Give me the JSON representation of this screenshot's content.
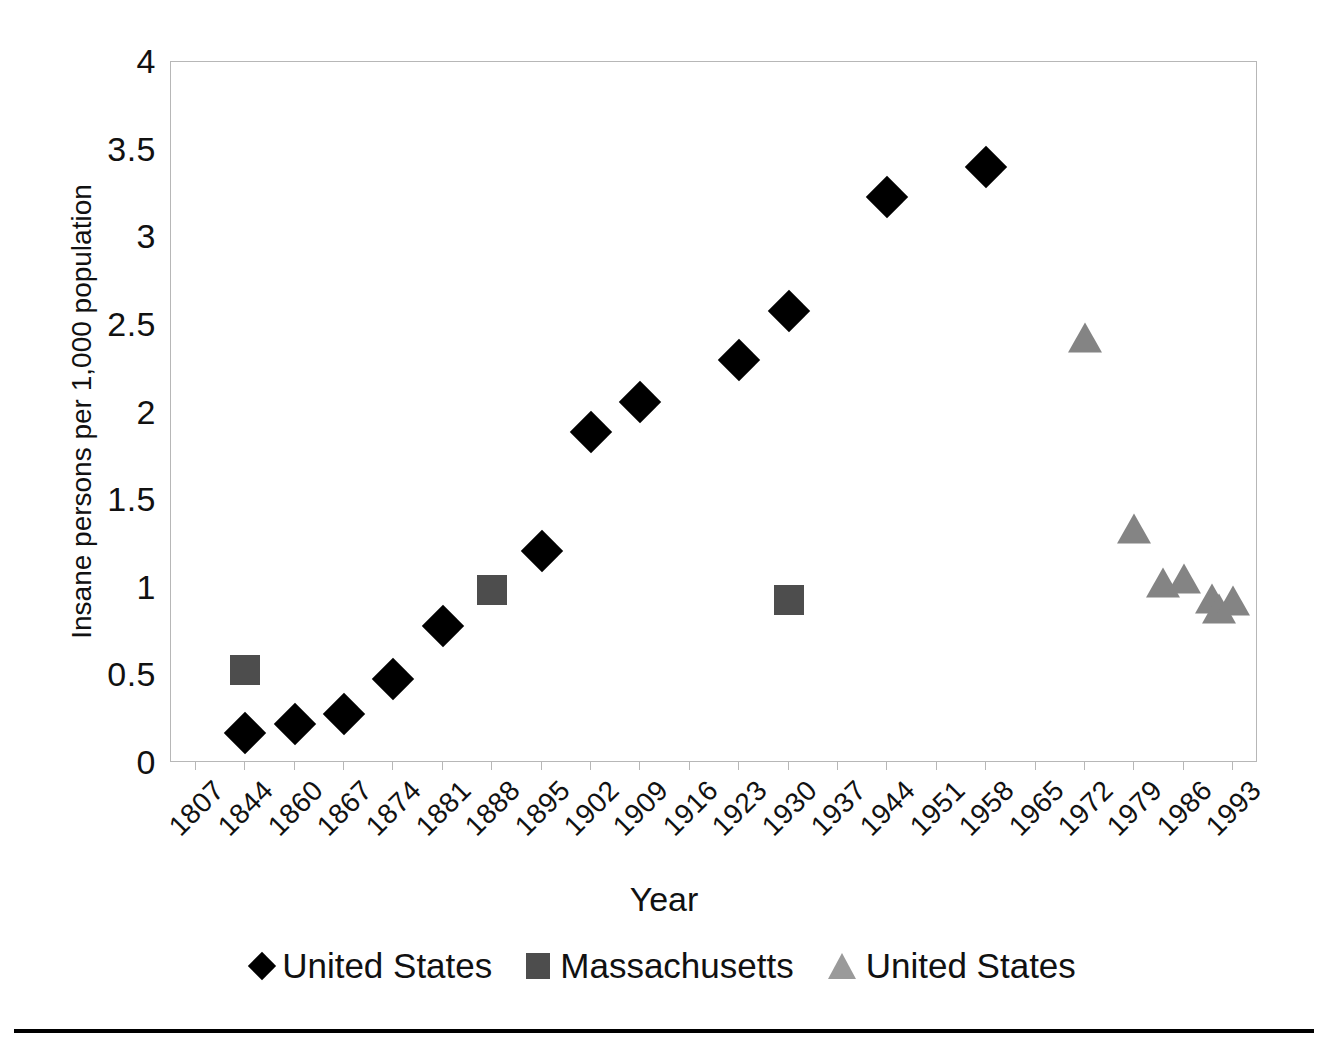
{
  "chart_data": {
    "type": "scatter",
    "title": "",
    "xlabel": "Year",
    "ylabel": "Insane persons per 1,000 population",
    "ylim": [
      0,
      4
    ],
    "y_ticks": [
      "0",
      "0.5",
      "1",
      "1.5",
      "2",
      "2.5",
      "3",
      "3.5",
      "4"
    ],
    "y_tick_values": [
      0,
      0.5,
      1,
      1.5,
      2,
      2.5,
      3,
      3.5,
      4
    ],
    "categories": [
      "1807",
      "1844",
      "1860",
      "1867",
      "1874",
      "1881",
      "1888",
      "1895",
      "1902",
      "1909",
      "1916",
      "1923",
      "1930",
      "1937",
      "1944",
      "1951",
      "1958",
      "1965",
      "1972",
      "1979",
      "1986",
      "1993"
    ],
    "grid": false,
    "legend_position": "bottom",
    "series": [
      {
        "name": "United States",
        "marker": "diamond",
        "color": "#000000",
        "points": [
          {
            "x": "1844",
            "y": 0.17
          },
          {
            "x": "1860",
            "y": 0.22
          },
          {
            "x": "1867",
            "y": 0.28
          },
          {
            "x": "1874",
            "y": 0.48
          },
          {
            "x": "1881",
            "y": 0.78
          },
          {
            "x": "1895",
            "y": 1.21
          },
          {
            "x": "1902",
            "y": 1.89
          },
          {
            "x": "1909",
            "y": 2.06
          },
          {
            "x": "1923",
            "y": 2.3
          },
          {
            "x": "1930",
            "y": 2.58
          },
          {
            "x": "1944",
            "y": 3.23
          },
          {
            "x": "1958",
            "y": 3.4
          }
        ]
      },
      {
        "name": "Massachusetts",
        "marker": "square",
        "color": "#4d4d4d",
        "points": [
          {
            "x": "1844",
            "y": 0.53
          },
          {
            "x": "1888",
            "y": 0.99
          },
          {
            "x": "1930",
            "y": 0.93
          }
        ]
      },
      {
        "name": "United States",
        "marker": "triangle",
        "color": "#848484",
        "points": [
          {
            "x": "1972",
            "y": 2.41
          },
          {
            "x": "1979",
            "y": 1.32
          },
          {
            "x": "1983",
            "y": 1.01
          },
          {
            "x": "1986",
            "y": 1.03
          },
          {
            "x": "1990",
            "y": 0.92
          },
          {
            "x": "1991",
            "y": 0.86
          },
          {
            "x": "1993",
            "y": 0.91
          }
        ]
      }
    ]
  },
  "axes": {
    "y_title": "Insane persons per 1,000 population",
    "x_title": "Year"
  },
  "legend": {
    "items": [
      {
        "label": "United States",
        "marker": "diamond-marker-icon"
      },
      {
        "label": "Massachusetts",
        "marker": "square-marker-icon"
      },
      {
        "label": "United States",
        "marker": "triangle-marker-icon"
      }
    ]
  },
  "colors": {
    "series_1": "#000000",
    "series_2": "#4d4d4d",
    "series_3": "#848484",
    "frame": "#b7b7b7",
    "text": "#111111"
  }
}
